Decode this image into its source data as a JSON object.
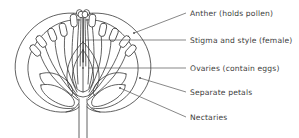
{
  "figure": {
    "background_color": "#ffffff",
    "line_color": "#3a3a3a",
    "leader_color": "#555555",
    "text_color": "#3d3d3d"
  },
  "labels": [
    {
      "id": "anther",
      "text": "Anther (holds pollen)",
      "x": 190,
      "y": 9,
      "leader": {
        "x1": 186,
        "y1": 13,
        "x2": 134,
        "y2": 33,
        "dot": true
      }
    },
    {
      "id": "stigma-style",
      "text": "Stigma and style (female)",
      "x": 190,
      "y": 36,
      "leader": {
        "x1": 186,
        "y1": 40,
        "x2": 85,
        "y2": 40,
        "dot": false
      }
    },
    {
      "id": "ovaries",
      "text": "Ovaries (contain eggs)",
      "x": 190,
      "y": 64,
      "leader": {
        "x1": 186,
        "y1": 68,
        "x2": 88,
        "y2": 68,
        "dot": true
      }
    },
    {
      "id": "separate-petals",
      "text": "Separate petals",
      "x": 190,
      "y": 88,
      "leader": {
        "x1": 186,
        "y1": 92,
        "x2": 140,
        "y2": 78,
        "dot": true
      }
    },
    {
      "id": "nectaries",
      "text": "Nectaries",
      "x": 190,
      "y": 113,
      "leader": {
        "x1": 186,
        "y1": 117,
        "x2": 120,
        "y2": 88,
        "dot": true
      }
    }
  ],
  "parts": {
    "anther": "Anther (holds pollen)",
    "stigma_style": "Stigma and style (female)",
    "ovaries": "Ovaries (contain eggs)",
    "separate_petals": "Separate petals",
    "nectaries": "Nectaries",
    "stem": "Stem",
    "receptacle": "Receptacle"
  }
}
